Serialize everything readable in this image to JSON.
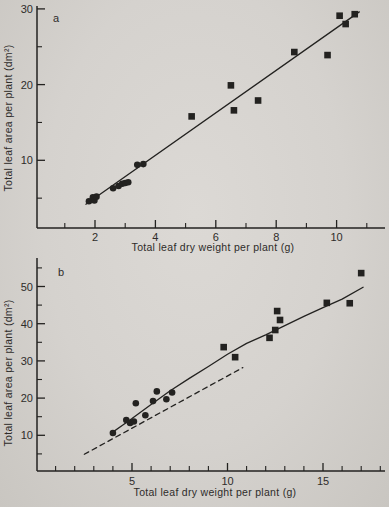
{
  "page": {
    "background": "#d5d2ce",
    "ink": "#232220"
  },
  "chart_data": [
    {
      "panel": "a",
      "type": "scatter",
      "title": "",
      "xlabel": "Total leaf dry weight per plant (g)",
      "ylabel": "Total leaf area per plant (dm²)",
      "xlim": [
        0,
        11.6
      ],
      "ylim": [
        0,
        30.5
      ],
      "grid": false,
      "legend": "none",
      "x_ticks_labeled": [
        2,
        4,
        6,
        8,
        10
      ],
      "x_ticks_minor": [
        1,
        3,
        5,
        7,
        9,
        11
      ],
      "y_ticks_labeled": [
        10,
        20,
        30
      ],
      "y_ticks_minor": [
        5,
        15,
        25
      ],
      "series": [
        {
          "name": "circle markers",
          "marker": "circle",
          "points": [
            [
              1.8,
              4.6
            ],
            [
              1.93,
              5.1
            ],
            [
              1.98,
              4.7
            ],
            [
              2.05,
              5.2
            ],
            [
              2.6,
              6.3
            ],
            [
              2.78,
              6.6
            ],
            [
              2.9,
              6.9
            ],
            [
              3.0,
              7.0
            ],
            [
              3.1,
              7.1
            ],
            [
              3.4,
              9.4
            ],
            [
              3.6,
              9.5
            ]
          ]
        },
        {
          "name": "square markers",
          "marker": "square",
          "points": [
            [
              5.2,
              15.8
            ],
            [
              6.5,
              19.9
            ],
            [
              6.6,
              16.6
            ],
            [
              7.4,
              17.9
            ],
            [
              8.6,
              24.3
            ],
            [
              9.7,
              23.9
            ],
            [
              10.1,
              29.1
            ],
            [
              10.3,
              28.0
            ],
            [
              10.6,
              29.3
            ]
          ]
        }
      ],
      "fit_lines": [
        {
          "name": "regression line",
          "style": "solid",
          "points": [
            [
              1.7,
              4.2
            ],
            [
              10.75,
              29.6
            ]
          ]
        }
      ]
    },
    {
      "panel": "b",
      "type": "scatter",
      "title": "",
      "xlabel": "Total leaf dry weight per plant (g)",
      "ylabel": "Total leaf area per plant (dm²)",
      "xlim": [
        0,
        18.3
      ],
      "ylim": [
        0,
        57
      ],
      "grid": false,
      "legend": "none",
      "x_ticks_labeled": [
        5,
        10,
        15
      ],
      "x_ticks_minor": [
        1,
        2,
        3,
        4,
        6,
        7,
        8,
        9,
        11,
        12,
        13,
        14,
        16,
        17,
        18
      ],
      "y_ticks_labeled": [
        10,
        20,
        30,
        40,
        50
      ],
      "y_ticks_minor": [
        5,
        15,
        25,
        35,
        45,
        55
      ],
      "series": [
        {
          "name": "circle markers",
          "marker": "circle",
          "points": [
            [
              4.0,
              10.6
            ],
            [
              4.7,
              14.1
            ],
            [
              4.9,
              13.3
            ],
            [
              5.1,
              13.7
            ],
            [
              5.2,
              18.6
            ],
            [
              5.7,
              15.4
            ],
            [
              6.1,
              19.2
            ],
            [
              6.3,
              21.8
            ],
            [
              6.8,
              19.7
            ],
            [
              7.1,
              21.5
            ]
          ]
        },
        {
          "name": "square markers",
          "marker": "square",
          "points": [
            [
              9.8,
              33.7
            ],
            [
              10.4,
              31.0
            ],
            [
              12.2,
              36.2
            ],
            [
              12.5,
              38.3
            ],
            [
              12.6,
              43.4
            ],
            [
              12.75,
              41.0
            ],
            [
              15.2,
              45.6
            ],
            [
              16.4,
              45.5
            ],
            [
              17.0,
              53.6
            ]
          ]
        }
      ],
      "fit_lines": [
        {
          "name": "fitted curve",
          "style": "solid",
          "points": [
            [
              3.9,
              10.5
            ],
            [
              4.5,
              12.7
            ],
            [
              5,
              14.5
            ],
            [
              6,
              18.3
            ],
            [
              7,
              22.0
            ],
            [
              8,
              25.3
            ],
            [
              9,
              28.5
            ],
            [
              10,
              31.8
            ],
            [
              11,
              34.7
            ],
            [
              12,
              37.0
            ],
            [
              13,
              39.5
            ],
            [
              14,
              42.0
            ],
            [
              15,
              44.3
            ],
            [
              16,
              46.6
            ],
            [
              17.1,
              49.8
            ]
          ]
        },
        {
          "name": "reference dashed line",
          "style": "dashed",
          "points": [
            [
              2.5,
              4.9
            ],
            [
              10.8,
              28.2
            ]
          ]
        }
      ]
    }
  ]
}
